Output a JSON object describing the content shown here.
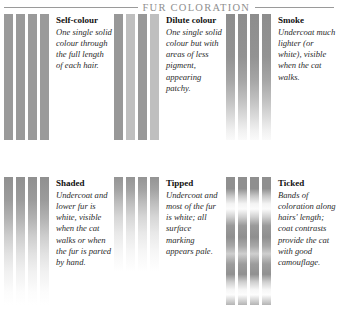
{
  "header": {
    "title": "FUR COLORATION",
    "rule_color": "#9a9a9a",
    "title_color": "#8f8f8f"
  },
  "panels": [
    {
      "id": "self-colour",
      "heading": "Self-colour",
      "description": "One single solid colour through the full length of each hair.",
      "hair_pattern": "uniform-mid-grey",
      "hair_count": 4
    },
    {
      "id": "dilute-colour",
      "heading": "Dilute colour",
      "description": "One single solid colour but with areas of less pigment, appearing patchy.",
      "hair_pattern": "alternating-dark-light",
      "hair_count": 4
    },
    {
      "id": "smoke",
      "heading": "Smoke",
      "description": "Undercoat much lighter (or white), visible when the cat walks.",
      "hair_pattern": "dark-top-pale-base",
      "hair_count": 4
    },
    {
      "id": "shaded",
      "heading": "Shaded",
      "description": "Undercoat and lower fur is white, visible when the cat walks or when the fur is parted by hand.",
      "hair_pattern": "dark-upper-third-white-base",
      "hair_count": 4
    },
    {
      "id": "tipped",
      "heading": "Tipped",
      "description": "Undercoat and most of the fur is white; all surface marking appears pale.",
      "hair_pattern": "coloured-tip-only",
      "hair_count": 4
    },
    {
      "id": "ticked",
      "heading": "Ticked",
      "description": "Bands of coloration along hairs' length; coat contrasts provide the cat with good camouflage.",
      "hair_pattern": "banded",
      "hair_count": 4
    }
  ],
  "colors": {
    "hair_dark": "#8f8f8f",
    "hair_mid": "#9a9a9a",
    "hair_light": "#bfbfbf",
    "hair_white": "#ffffff"
  }
}
